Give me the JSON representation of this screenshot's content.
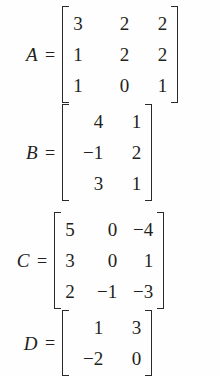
{
  "document": {
    "kind": "math-matrix-definitions",
    "equals_sign": "=",
    "text_color": "#231f20",
    "background_color": "#fefefe",
    "bracket_color": "#2a2a2a"
  },
  "matrices": [
    {
      "id": "A",
      "label": "A",
      "rows": 3,
      "cols": 3,
      "values": [
        [
          "3",
          "2",
          "2"
        ],
        [
          "1",
          "2",
          "2"
        ],
        [
          "1",
          "0",
          "1"
        ]
      ]
    },
    {
      "id": "B",
      "label": "B",
      "rows": 3,
      "cols": 2,
      "values": [
        [
          "4",
          "1"
        ],
        [
          "−1",
          "2"
        ],
        [
          "3",
          "1"
        ]
      ]
    },
    {
      "id": "C",
      "label": "C",
      "rows": 3,
      "cols": 3,
      "values": [
        [
          "5",
          "0",
          "−4"
        ],
        [
          "3",
          "0",
          "1"
        ],
        [
          "2",
          "−1",
          "−3"
        ]
      ]
    },
    {
      "id": "D",
      "label": "D",
      "rows": 2,
      "cols": 2,
      "values": [
        [
          "1",
          "3"
        ],
        [
          "−2",
          "0"
        ]
      ]
    }
  ]
}
